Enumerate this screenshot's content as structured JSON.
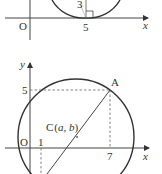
{
  "figure_top": {
    "origin_label": "O",
    "x_axis_label": "x",
    "tangent_x_label": "5",
    "radius_label": "3",
    "right_angle_marker": "right-angle-icon"
  },
  "figure_bottom": {
    "origin_label": "O",
    "x_axis_label": "x",
    "y_axis_label": "y",
    "y_tick_label": "5",
    "x_tick_labels": [
      "1",
      "7"
    ],
    "point_a_label": "A",
    "center_label": "C",
    "center_coords": "(a, b)",
    "center_a": "a",
    "center_b": "b"
  },
  "colors": {
    "stroke": "#333333",
    "axis": "#444444",
    "dashed": "#666666"
  }
}
